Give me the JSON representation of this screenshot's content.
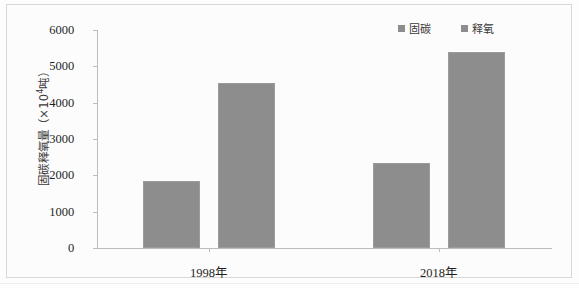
{
  "chart_data": {
    "type": "bar",
    "title": "",
    "xlabel": "",
    "ylabel": "固碳释氧量（×10⁴吨）",
    "ylabel_prefix": "固碳释氧量（×10",
    "ylabel_exponent": "4",
    "ylabel_suffix": "吨）",
    "categories": [
      "1998年",
      "2018年"
    ],
    "series": [
      {
        "name": "固碳",
        "values": [
          1850,
          2330
        ]
      },
      {
        "name": "释氧",
        "values": [
          4540,
          5400
        ]
      }
    ],
    "ylim": [
      0,
      6000
    ],
    "yticks": [
      0,
      1000,
      2000,
      3000,
      4000,
      5000,
      6000
    ],
    "ytick_labels": [
      "0",
      "1000",
      "2000",
      "3000",
      "4000",
      "5000",
      "6000"
    ],
    "grid": false,
    "legend_position": "top-right",
    "bar_color": "#8d8d8d"
  },
  "axis": {
    "tick_0": "0",
    "tick_1": "1000",
    "tick_2": "2000",
    "tick_3": "3000",
    "tick_4": "4000",
    "tick_5": "5000",
    "tick_6": "6000"
  },
  "categories": {
    "cat_0": "1998年",
    "cat_1": "2018年"
  },
  "legend": {
    "item_0": "固碳",
    "item_1": "释氧"
  }
}
